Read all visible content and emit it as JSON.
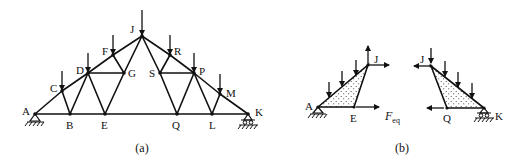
{
  "figure": {
    "panel_a": {
      "caption": "(a)",
      "nodes": [
        {
          "id": "A",
          "x": 35,
          "y": 114,
          "lx": 22,
          "ly": 115
        },
        {
          "id": "B",
          "x": 70,
          "y": 114,
          "lx": 66,
          "ly": 129
        },
        {
          "id": "C",
          "x": 62,
          "y": 91,
          "lx": 50,
          "ly": 92
        },
        {
          "id": "D",
          "x": 88,
          "y": 73,
          "lx": 76,
          "ly": 74
        },
        {
          "id": "E",
          "x": 105,
          "y": 114,
          "lx": 101,
          "ly": 129
        },
        {
          "id": "F",
          "x": 113,
          "y": 55,
          "lx": 102,
          "ly": 55
        },
        {
          "id": "G",
          "x": 124,
          "y": 73,
          "lx": 128,
          "ly": 77
        },
        {
          "id": "J",
          "x": 142,
          "y": 36,
          "lx": 130,
          "ly": 33
        },
        {
          "id": "R",
          "x": 170,
          "y": 55,
          "lx": 174,
          "ly": 55
        },
        {
          "id": "S",
          "x": 160,
          "y": 73,
          "lx": 149,
          "ly": 77
        },
        {
          "id": "P",
          "x": 194,
          "y": 73,
          "lx": 199,
          "ly": 75
        },
        {
          "id": "M",
          "x": 220,
          "y": 94,
          "lx": 226,
          "ly": 97
        },
        {
          "id": "Q",
          "x": 177,
          "y": 114,
          "lx": 172,
          "ly": 129
        },
        {
          "id": "L",
          "x": 212,
          "y": 114,
          "lx": 209,
          "ly": 129
        },
        {
          "id": "K",
          "x": 248,
          "y": 114,
          "lx": 255,
          "ly": 116
        }
      ],
      "members": [
        [
          "A",
          "C"
        ],
        [
          "C",
          "D"
        ],
        [
          "D",
          "F"
        ],
        [
          "F",
          "J"
        ],
        [
          "J",
          "R"
        ],
        [
          "R",
          "P"
        ],
        [
          "P",
          "M"
        ],
        [
          "M",
          "K"
        ],
        [
          "A",
          "B"
        ],
        [
          "B",
          "E"
        ],
        [
          "E",
          "Q"
        ],
        [
          "Q",
          "L"
        ],
        [
          "L",
          "K"
        ],
        [
          "C",
          "B"
        ],
        [
          "B",
          "D"
        ],
        [
          "D",
          "E"
        ],
        [
          "D",
          "G"
        ],
        [
          "F",
          "G"
        ],
        [
          "G",
          "E"
        ],
        [
          "G",
          "J"
        ],
        [
          "J",
          "S"
        ],
        [
          "S",
          "R"
        ],
        [
          "S",
          "P"
        ],
        [
          "S",
          "Q"
        ],
        [
          "Q",
          "P"
        ],
        [
          "P",
          "L"
        ],
        [
          "L",
          "M"
        ]
      ],
      "loads": [
        "C",
        "D",
        "F",
        "J",
        "R",
        "P",
        "M"
      ],
      "supports": {
        "pin": "A",
        "roller": "K"
      }
    },
    "panel_b": {
      "caption": "(b)",
      "force_label": "F",
      "force_subscript": "eq",
      "left_body": {
        "nodes": [
          {
            "id": "A",
            "x": 318,
            "y": 107,
            "lx": 305,
            "ly": 110
          },
          {
            "id": "E",
            "x": 354,
            "y": 107,
            "lx": 350,
            "ly": 122
          },
          {
            "id": "J",
            "x": 368,
            "y": 65,
            "lx": 374,
            "ly": 63
          }
        ]
      },
      "right_body": {
        "nodes": [
          {
            "id": "J",
            "x": 431,
            "y": 66,
            "lx": 420,
            "ly": 63
          },
          {
            "id": "Q",
            "x": 447,
            "y": 108,
            "lx": 443,
            "ly": 122
          },
          {
            "id": "K",
            "x": 484,
            "y": 108,
            "lx": 495,
            "ly": 120
          }
        ]
      }
    }
  }
}
